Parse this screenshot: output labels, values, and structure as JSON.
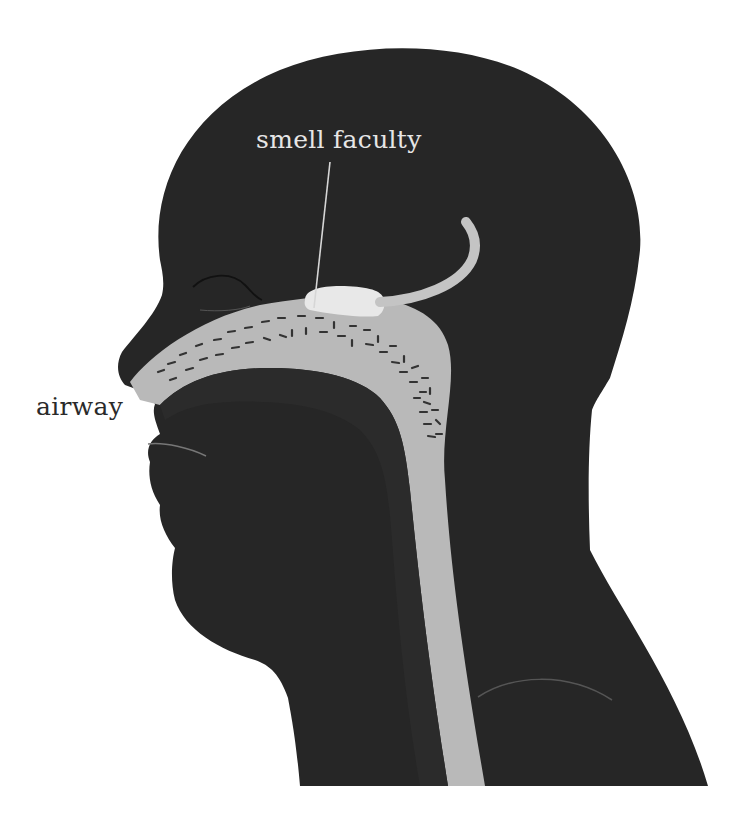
{
  "figure": {
    "labels": {
      "smell_faculty": "smell faculty",
      "airway": "airway"
    },
    "colors": {
      "background": "#ffffff",
      "head_silhouette": "#262626",
      "airway_tube": "#b9b9b9",
      "smell_organ": "#e8e8e8",
      "nerve": "#c4c4c4",
      "leader_line": "#d6d6d6",
      "airway_label": "#2a2a2a",
      "smell_label": "#e6e6e6"
    },
    "elements": [
      "head-silhouette",
      "airway-tube",
      "nasal-cilia-dashes",
      "smell-organ",
      "olfactory-nerve",
      "leader-line",
      "eye-line",
      "mouth-line",
      "shoulder-line"
    ]
  }
}
